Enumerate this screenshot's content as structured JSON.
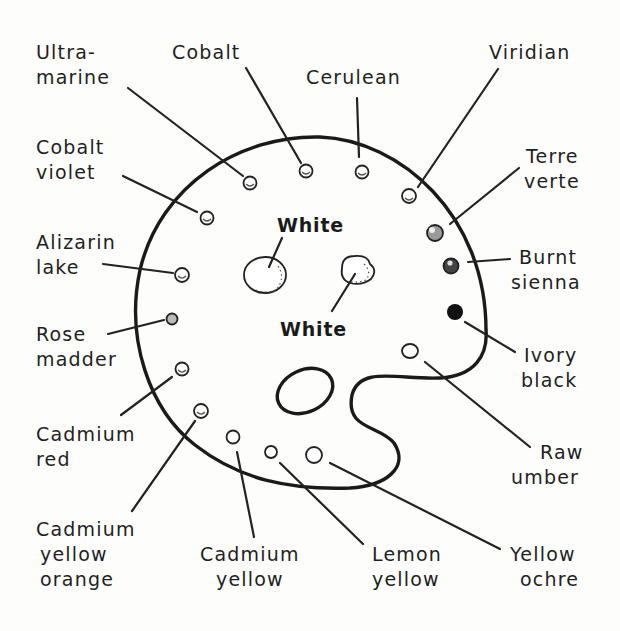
{
  "diagram": {
    "colors": {
      "ink": "#1f1f1f",
      "paper": "#fdfdfc",
      "ivory_black_fill": "#111111",
      "burnt_sienna_fill": "#555555",
      "terre_verte_fill": "#888888"
    },
    "center_labels": {
      "white_top": "White",
      "white_bottom": "White"
    },
    "pigments": [
      {
        "id": "ultramarine",
        "lines": [
          "Ultra-",
          "marine"
        ]
      },
      {
        "id": "cobalt",
        "lines": [
          "Cobalt"
        ]
      },
      {
        "id": "cerulean",
        "lines": [
          "Cerulean"
        ]
      },
      {
        "id": "viridian",
        "lines": [
          "Viridian"
        ]
      },
      {
        "id": "terre-verte",
        "lines": [
          "Terre",
          "verte"
        ]
      },
      {
        "id": "burnt-sienna",
        "lines": [
          "Burnt",
          "sienna"
        ]
      },
      {
        "id": "ivory-black",
        "lines": [
          "Ivory",
          "black"
        ]
      },
      {
        "id": "raw-umber",
        "lines": [
          "Raw",
          "umber"
        ]
      },
      {
        "id": "yellow-ochre",
        "lines": [
          "Yellow",
          "ochre"
        ]
      },
      {
        "id": "lemon-yellow",
        "lines": [
          "Lemon",
          "yellow"
        ]
      },
      {
        "id": "cadmium-yellow",
        "lines": [
          "Cadmium",
          "yellow"
        ]
      },
      {
        "id": "cadmium-yellow-orange",
        "lines": [
          "Cadmium",
          "yellow",
          "orange"
        ]
      },
      {
        "id": "cadmium-red",
        "lines": [
          "Cadmium",
          "red"
        ]
      },
      {
        "id": "rose-madder",
        "lines": [
          "Rose",
          "madder"
        ]
      },
      {
        "id": "alizarin-lake",
        "lines": [
          "Alizarin",
          "lake"
        ]
      },
      {
        "id": "cobalt-violet",
        "lines": [
          "Cobalt",
          "violet"
        ]
      }
    ]
  }
}
